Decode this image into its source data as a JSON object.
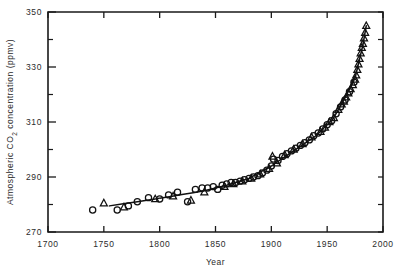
{
  "chart_data": {
    "type": "scatter",
    "title": "",
    "xlabel": "Year",
    "ylabel": "Atmospheric CO2 concentration (ppmv)",
    "ylabel_parts": {
      "pre": "Atmospheric CO",
      "sub": "2",
      "post": " concentration (ppmv)"
    },
    "xlim": [
      1700,
      2000
    ],
    "ylim": [
      270,
      350
    ],
    "xticks": [
      1700,
      1750,
      1800,
      1850,
      1900,
      1950,
      2000
    ],
    "yticks": [
      270,
      290,
      310,
      330,
      350
    ],
    "yticks_minor": [
      280,
      300,
      320,
      340
    ],
    "grid": false,
    "legend": "none",
    "frame": "box",
    "tick_direction": "in",
    "series": [
      {
        "name": "ice-core circles",
        "marker": "circle",
        "points": [
          [
            1740,
            278.0
          ],
          [
            1762,
            278.0
          ],
          [
            1772,
            279.5
          ],
          [
            1780,
            281.0
          ],
          [
            1790,
            282.5
          ],
          [
            1800,
            282.0
          ],
          [
            1808,
            283.5
          ],
          [
            1816,
            284.5
          ],
          [
            1825,
            281.0
          ],
          [
            1832,
            285.5
          ],
          [
            1838,
            286.0
          ],
          [
            1843,
            286.0
          ],
          [
            1848,
            286.5
          ],
          [
            1852,
            285.5
          ],
          [
            1856,
            287.0
          ],
          [
            1860,
            287.5
          ],
          [
            1864,
            288.0
          ],
          [
            1868,
            288.0
          ],
          [
            1872,
            288.5
          ],
          [
            1876,
            289.0
          ],
          [
            1880,
            289.5
          ],
          [
            1884,
            290.0
          ],
          [
            1888,
            290.5
          ],
          [
            1892,
            291.5
          ],
          [
            1896,
            292.5
          ],
          [
            1900,
            294.0
          ],
          [
            1902,
            296.5
          ],
          [
            1906,
            296.0
          ],
          [
            1910,
            297.5
          ],
          [
            1914,
            298.5
          ],
          [
            1918,
            299.5
          ],
          [
            1922,
            300.5
          ],
          [
            1926,
            301.5
          ],
          [
            1930,
            302.5
          ],
          [
            1934,
            303.5
          ],
          [
            1938,
            305.0
          ],
          [
            1942,
            306.0
          ],
          [
            1946,
            307.5
          ],
          [
            1950,
            309.0
          ],
          [
            1954,
            310.5
          ],
          [
            1958,
            313.0
          ],
          [
            1962,
            315.5
          ],
          [
            1966,
            318.0
          ],
          [
            1970,
            321.0
          ],
          [
            1974,
            324.5
          ]
        ]
      },
      {
        "name": "ice-core triangles",
        "marker": "triangle",
        "points": [
          [
            1750,
            280.5
          ],
          [
            1768,
            279.0
          ],
          [
            1796,
            282.0
          ],
          [
            1812,
            283.0
          ],
          [
            1828,
            281.5
          ],
          [
            1840,
            284.5
          ],
          [
            1858,
            286.5
          ],
          [
            1866,
            287.5
          ],
          [
            1874,
            288.5
          ],
          [
            1882,
            289.5
          ],
          [
            1890,
            291.0
          ],
          [
            1898,
            293.0
          ],
          [
            1901,
            297.5
          ],
          [
            1905,
            295.0
          ],
          [
            1912,
            298.0
          ],
          [
            1920,
            300.0
          ],
          [
            1928,
            302.0
          ],
          [
            1936,
            304.5
          ],
          [
            1944,
            306.5
          ],
          [
            1948,
            308.0
          ],
          [
            1952,
            310.0
          ],
          [
            1956,
            311.5
          ],
          [
            1960,
            314.5
          ],
          [
            1963,
            316.5
          ],
          [
            1965,
            317.5
          ],
          [
            1967,
            319.0
          ],
          [
            1969,
            320.5
          ],
          [
            1971,
            322.0
          ],
          [
            1973,
            323.5
          ],
          [
            1975,
            325.5
          ],
          [
            1976,
            327.0
          ],
          [
            1977,
            329.0
          ],
          [
            1978,
            331.0
          ],
          [
            1979,
            333.0
          ],
          [
            1980,
            335.0
          ],
          [
            1981,
            337.0
          ],
          [
            1982,
            338.5
          ],
          [
            1983,
            340.5
          ],
          [
            1984,
            342.5
          ],
          [
            1985,
            345.0
          ]
        ]
      }
    ],
    "trendline": {
      "name": "fitted smooth curve",
      "points": [
        [
          1755,
          279.5
        ],
        [
          1780,
          281.0
        ],
        [
          1800,
          282.3
        ],
        [
          1820,
          283.6
        ],
        [
          1840,
          285.0
        ],
        [
          1860,
          287.0
        ],
        [
          1880,
          289.5
        ],
        [
          1900,
          294.0
        ],
        [
          1920,
          299.5
        ],
        [
          1940,
          305.0
        ],
        [
          1955,
          311.0
        ],
        [
          1965,
          318.0
        ],
        [
          1975,
          326.0
        ],
        [
          1982,
          338.0
        ],
        [
          1985,
          345.0
        ]
      ]
    }
  }
}
